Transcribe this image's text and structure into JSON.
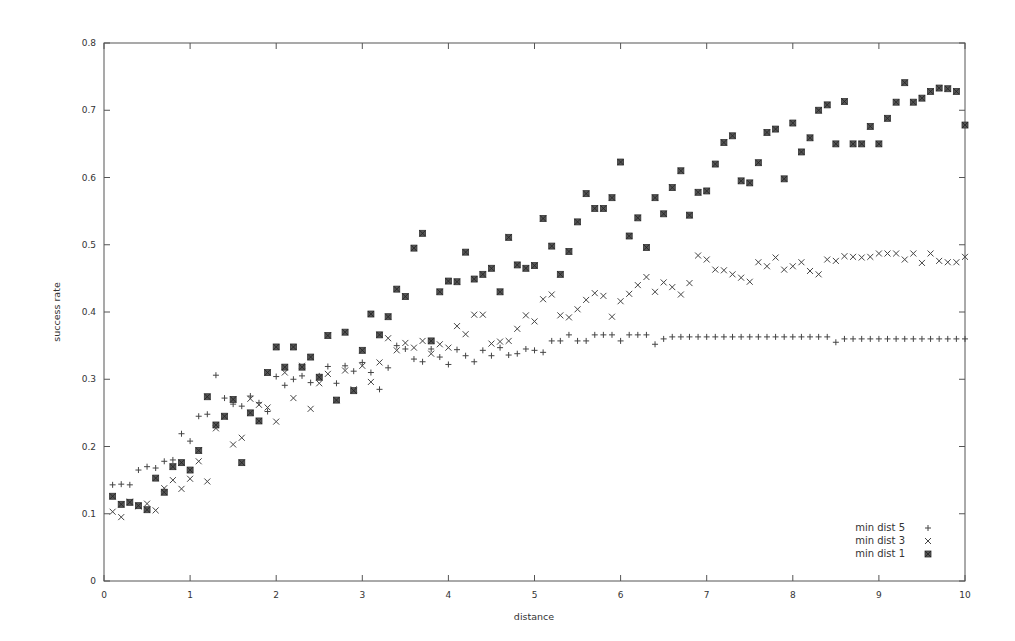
{
  "chart_data": {
    "type": "scatter",
    "title": "",
    "xlabel": "distance",
    "ylabel": "success rate",
    "xlim": [
      0,
      10
    ],
    "ylim": [
      0,
      0.8
    ],
    "xticks": [
      "0",
      "1",
      "2",
      "3",
      "4",
      "5",
      "6",
      "7",
      "8",
      "9",
      "10"
    ],
    "yticks": [
      "0",
      "0.1",
      "0.2",
      "0.3",
      "0.4",
      "0.5",
      "0.6",
      "0.7",
      "0.8"
    ],
    "grid": false,
    "legend_position": "bottom-right",
    "series": [
      {
        "name": "min dist 5",
        "marker": "plus",
        "x": [
          0.1,
          0.2,
          0.3,
          0.4,
          0.5,
          0.6,
          0.7,
          0.8,
          0.9,
          1.0,
          1.1,
          1.2,
          1.3,
          1.4,
          1.5,
          1.6,
          1.7,
          1.8,
          1.9,
          2.0,
          2.1,
          2.2,
          2.3,
          2.4,
          2.5,
          2.6,
          2.7,
          2.8,
          2.9,
          3.0,
          3.1,
          3.2,
          3.3,
          3.4,
          3.5,
          3.6,
          3.7,
          3.8,
          3.9,
          4.0,
          4.1,
          4.2,
          4.3,
          4.4,
          4.5,
          4.6,
          4.7,
          4.8,
          4.9,
          5.0,
          5.1,
          5.2,
          5.3,
          5.4,
          5.5,
          5.6,
          5.7,
          5.8,
          5.9,
          6.0,
          6.1,
          6.2,
          6.3,
          6.4,
          6.5,
          6.6,
          6.7,
          6.8,
          6.9,
          7.0,
          7.1,
          7.2,
          7.3,
          7.4,
          7.5,
          7.6,
          7.7,
          7.8,
          7.9,
          8.0,
          8.1,
          8.2,
          8.3,
          8.4,
          8.5,
          8.6,
          8.7,
          8.8,
          8.9,
          9.0,
          9.1,
          9.2,
          9.3,
          9.4,
          9.5,
          9.6,
          9.7,
          9.8,
          9.9,
          10.0
        ],
        "y": [
          0.143,
          0.144,
          0.143,
          0.165,
          0.17,
          0.168,
          0.178,
          0.18,
          0.219,
          0.208,
          0.245,
          0.248,
          0.306,
          0.272,
          0.263,
          0.26,
          0.275,
          0.265,
          0.252,
          0.304,
          0.291,
          0.3,
          0.305,
          0.295,
          0.305,
          0.319,
          0.294,
          0.32,
          0.312,
          0.325,
          0.31,
          0.285,
          0.317,
          0.35,
          0.345,
          0.33,
          0.326,
          0.345,
          0.333,
          0.322,
          0.344,
          0.335,
          0.326,
          0.343,
          0.335,
          0.347,
          0.336,
          0.338,
          0.345,
          0.343,
          0.34,
          0.357,
          0.357,
          0.366,
          0.357,
          0.357,
          0.366,
          0.366,
          0.366,
          0.357,
          0.366,
          0.366,
          0.366,
          0.352,
          0.36,
          0.363,
          0.363,
          0.363,
          0.363,
          0.363,
          0.363,
          0.363,
          0.363,
          0.363,
          0.363,
          0.363,
          0.363,
          0.363,
          0.363,
          0.363,
          0.363,
          0.363,
          0.363,
          0.363,
          0.355,
          0.36,
          0.36,
          0.36,
          0.36,
          0.36,
          0.36,
          0.36,
          0.36,
          0.36,
          0.36,
          0.36,
          0.36,
          0.36,
          0.36,
          0.36
        ]
      },
      {
        "name": "min dist 3",
        "marker": "cross",
        "x": [
          0.1,
          0.2,
          0.3,
          0.4,
          0.5,
          0.6,
          0.7,
          0.8,
          0.9,
          1.0,
          1.1,
          1.2,
          1.3,
          1.4,
          1.5,
          1.6,
          1.7,
          1.8,
          1.9,
          2.0,
          2.1,
          2.2,
          2.3,
          2.4,
          2.5,
          2.6,
          2.7,
          2.8,
          2.9,
          3.0,
          3.1,
          3.2,
          3.3,
          3.4,
          3.5,
          3.6,
          3.7,
          3.8,
          3.9,
          4.0,
          4.1,
          4.2,
          4.3,
          4.4,
          4.5,
          4.6,
          4.7,
          4.8,
          4.9,
          5.0,
          5.1,
          5.2,
          5.3,
          5.4,
          5.5,
          5.6,
          5.7,
          5.8,
          5.9,
          6.0,
          6.1,
          6.2,
          6.3,
          6.4,
          6.5,
          6.6,
          6.7,
          6.8,
          6.9,
          7.0,
          7.1,
          7.2,
          7.3,
          7.4,
          7.5,
          7.6,
          7.7,
          7.8,
          7.9,
          8.0,
          8.1,
          8.2,
          8.3,
          8.4,
          8.5,
          8.6,
          8.7,
          8.8,
          8.9,
          9.0,
          9.1,
          9.2,
          9.3,
          9.4,
          9.5,
          9.6,
          9.7,
          9.8,
          9.9,
          10.0
        ],
        "y": [
          0.103,
          0.095,
          0.118,
          0.111,
          0.115,
          0.105,
          0.138,
          0.15,
          0.137,
          0.152,
          0.178,
          0.148,
          0.227,
          0.244,
          0.203,
          0.213,
          0.271,
          0.262,
          0.258,
          0.237,
          0.31,
          0.272,
          0.32,
          0.256,
          0.294,
          0.308,
          0.269,
          0.313,
          0.285,
          0.32,
          0.296,
          0.325,
          0.361,
          0.343,
          0.354,
          0.347,
          0.357,
          0.338,
          0.352,
          0.347,
          0.379,
          0.367,
          0.396,
          0.396,
          0.353,
          0.356,
          0.357,
          0.375,
          0.395,
          0.386,
          0.419,
          0.426,
          0.395,
          0.392,
          0.404,
          0.418,
          0.428,
          0.424,
          0.393,
          0.416,
          0.427,
          0.44,
          0.452,
          0.43,
          0.444,
          0.437,
          0.426,
          0.443,
          0.484,
          0.478,
          0.463,
          0.462,
          0.456,
          0.451,
          0.445,
          0.474,
          0.468,
          0.481,
          0.463,
          0.468,
          0.474,
          0.461,
          0.456,
          0.478,
          0.476,
          0.483,
          0.482,
          0.481,
          0.482,
          0.487,
          0.487,
          0.487,
          0.478,
          0.487,
          0.473,
          0.487,
          0.476,
          0.474,
          0.474,
          0.482
        ]
      },
      {
        "name": "min dist 1",
        "marker": "filled-square",
        "x": [
          0.1,
          0.2,
          0.3,
          0.4,
          0.5,
          0.6,
          0.7,
          0.8,
          0.9,
          1.0,
          1.1,
          1.2,
          1.3,
          1.4,
          1.5,
          1.6,
          1.7,
          1.8,
          1.9,
          2.0,
          2.1,
          2.2,
          2.3,
          2.4,
          2.5,
          2.6,
          2.7,
          2.8,
          2.9,
          3.0,
          3.1,
          3.2,
          3.3,
          3.4,
          3.5,
          3.6,
          3.7,
          3.8,
          3.9,
          4.0,
          4.1,
          4.2,
          4.3,
          4.4,
          4.5,
          4.6,
          4.7,
          4.8,
          4.9,
          5.0,
          5.1,
          5.2,
          5.3,
          5.4,
          5.5,
          5.6,
          5.7,
          5.8,
          5.9,
          6.0,
          6.1,
          6.2,
          6.3,
          6.4,
          6.5,
          6.6,
          6.7,
          6.8,
          6.9,
          7.0,
          7.1,
          7.2,
          7.3,
          7.4,
          7.5,
          7.6,
          7.7,
          7.8,
          7.9,
          8.0,
          8.1,
          8.2,
          8.3,
          8.4,
          8.5,
          8.6,
          8.7,
          8.8,
          8.9,
          9.0,
          9.1,
          9.2,
          9.3,
          9.4,
          9.5,
          9.6,
          9.7,
          9.8,
          9.9,
          10.0
        ],
        "y": [
          0.126,
          0.114,
          0.117,
          0.112,
          0.106,
          0.153,
          0.132,
          0.17,
          0.176,
          0.165,
          0.194,
          0.274,
          0.232,
          0.245,
          0.27,
          0.176,
          0.25,
          0.238,
          0.31,
          0.348,
          0.318,
          0.348,
          0.318,
          0.333,
          0.303,
          0.365,
          0.269,
          0.37,
          0.283,
          0.343,
          0.397,
          0.366,
          0.393,
          0.434,
          0.423,
          0.495,
          0.517,
          0.357,
          0.43,
          0.446,
          0.445,
          0.489,
          0.449,
          0.456,
          0.465,
          0.43,
          0.511,
          0.47,
          0.465,
          0.469,
          0.539,
          0.498,
          0.456,
          0.49,
          0.534,
          0.576,
          0.554,
          0.554,
          0.57,
          0.623,
          0.513,
          0.54,
          0.496,
          0.57,
          0.546,
          0.585,
          0.61,
          0.544,
          0.578,
          0.58,
          0.62,
          0.652,
          0.662,
          0.595,
          0.592,
          0.622,
          0.667,
          0.672,
          0.598,
          0.681,
          0.638,
          0.659,
          0.7,
          0.708,
          0.65,
          0.713,
          0.65,
          0.65,
          0.676,
          0.65,
          0.688,
          0.712,
          0.741,
          0.712,
          0.718,
          0.728,
          0.733,
          0.732,
          0.728,
          0.678
        ]
      }
    ]
  },
  "legend": {
    "items": [
      {
        "label": "min dist 5",
        "symbol": "+"
      },
      {
        "label": "min dist 3",
        "symbol": "×"
      },
      {
        "label": "min dist 1",
        "symbol": "■"
      }
    ]
  },
  "colors": {
    "axis": "#555555",
    "marker": "#444444",
    "background": "#ffffff"
  }
}
